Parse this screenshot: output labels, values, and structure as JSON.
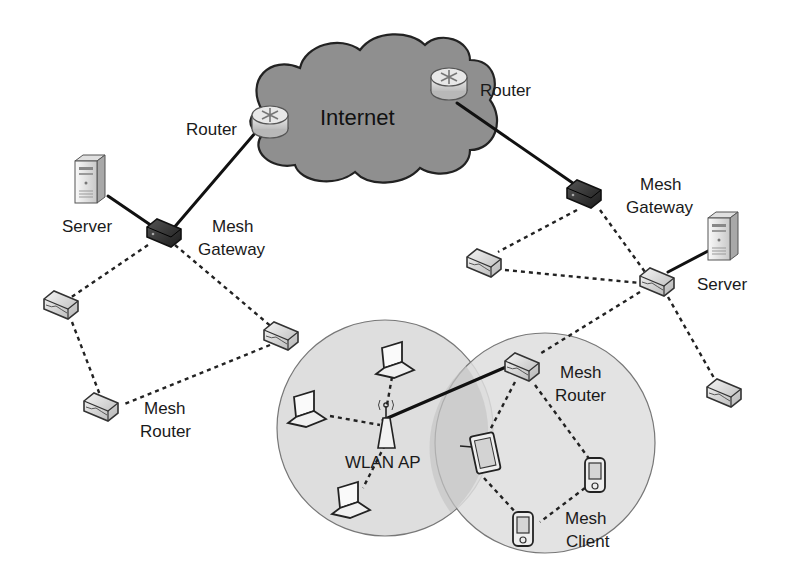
{
  "diagram": {
    "type": "network-topology",
    "colors": {
      "background": "#ffffff",
      "cloud_fill": "#8c8c8c",
      "coverage_fill": "#dcdcdc",
      "overlap_fill": "#c4c4c4",
      "line": "#111111",
      "gateway": "#2b2b2b",
      "mesh_router": "#e6e6e6"
    },
    "labels": {
      "internet": "Internet",
      "router_left": "Router",
      "router_right": "Router",
      "server_left": "Server",
      "server_right": "Server",
      "gateway_left_line1": "Mesh",
      "gateway_left_line2": "Gateway",
      "gateway_right_line1": "Mesh",
      "gateway_right_line2": "Gateway",
      "mesh_router_left_line1": "Mesh",
      "mesh_router_left_line2": "Router",
      "mesh_router_center_line1": "Mesh",
      "mesh_router_center_line2": "Router",
      "wlan_ap": "WLAN AP",
      "mesh_client_line1": "Mesh",
      "mesh_client_line2": "Client"
    },
    "nodes": [
      {
        "id": "internet",
        "kind": "cloud",
        "label": "Internet"
      },
      {
        "id": "router_l",
        "kind": "router",
        "label": "Router"
      },
      {
        "id": "router_r",
        "kind": "router",
        "label": "Router"
      },
      {
        "id": "gw_l",
        "kind": "mesh-gateway",
        "label": "Mesh Gateway"
      },
      {
        "id": "gw_r",
        "kind": "mesh-gateway",
        "label": "Mesh Gateway"
      },
      {
        "id": "server_l",
        "kind": "server",
        "label": "Server"
      },
      {
        "id": "server_r",
        "kind": "server",
        "label": "Server"
      },
      {
        "id": "mr_l1",
        "kind": "mesh-router"
      },
      {
        "id": "mr_l2",
        "kind": "mesh-router"
      },
      {
        "id": "mr_l3",
        "kind": "mesh-router",
        "label": "Mesh Router"
      },
      {
        "id": "mr_r1",
        "kind": "mesh-router"
      },
      {
        "id": "mr_r2",
        "kind": "mesh-router"
      },
      {
        "id": "mr_r3",
        "kind": "mesh-router"
      },
      {
        "id": "mr_c",
        "kind": "mesh-router",
        "label": "Mesh Router"
      },
      {
        "id": "ap",
        "kind": "wlan-ap",
        "label": "WLAN AP"
      },
      {
        "id": "laptop1",
        "kind": "laptop"
      },
      {
        "id": "laptop2",
        "kind": "laptop"
      },
      {
        "id": "laptop3",
        "kind": "laptop"
      },
      {
        "id": "tablet",
        "kind": "mesh-client"
      },
      {
        "id": "pda1",
        "kind": "mesh-client"
      },
      {
        "id": "pda2",
        "kind": "mesh-client",
        "label": "Mesh Client"
      }
    ],
    "links": [
      {
        "from": "router_l",
        "to": "gw_l",
        "type": "wired"
      },
      {
        "from": "server_l",
        "to": "gw_l",
        "type": "wired"
      },
      {
        "from": "router_r",
        "to": "gw_r",
        "type": "wired"
      },
      {
        "from": "server_r",
        "to": "mr_r2",
        "type": "wired"
      },
      {
        "from": "ap",
        "to": "mr_c",
        "type": "wired"
      },
      {
        "from": "gw_l",
        "to": "mr_l1",
        "type": "wireless"
      },
      {
        "from": "gw_l",
        "to": "mr_l2",
        "type": "wireless"
      },
      {
        "from": "mr_l1",
        "to": "mr_l3",
        "type": "wireless"
      },
      {
        "from": "mr_l2",
        "to": "mr_l3",
        "type": "wireless"
      },
      {
        "from": "gw_r",
        "to": "mr_r1",
        "type": "wireless"
      },
      {
        "from": "gw_r",
        "to": "mr_r2",
        "type": "wireless"
      },
      {
        "from": "mr_r1",
        "to": "mr_r2",
        "type": "wireless"
      },
      {
        "from": "mr_r2",
        "to": "mr_r3",
        "type": "wireless"
      },
      {
        "from": "mr_r2",
        "to": "mr_c",
        "type": "wireless"
      },
      {
        "from": "ap",
        "to": "laptop1",
        "type": "wireless"
      },
      {
        "from": "ap",
        "to": "laptop2",
        "type": "wireless"
      },
      {
        "from": "ap",
        "to": "laptop3",
        "type": "wireless"
      },
      {
        "from": "mr_c",
        "to": "tablet",
        "type": "wireless"
      },
      {
        "from": "mr_c",
        "to": "pda1",
        "type": "wireless"
      },
      {
        "from": "tablet",
        "to": "pda2",
        "type": "wireless"
      },
      {
        "from": "pda1",
        "to": "pda2",
        "type": "wireless"
      }
    ]
  }
}
